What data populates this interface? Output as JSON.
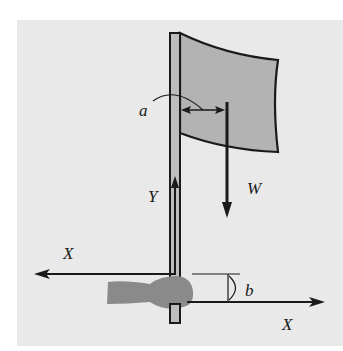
{
  "figure": {
    "colors": {
      "background": "#e9e9e9",
      "flag_fill": "#b3b3b3",
      "pole_fill": "#bdbdbd",
      "hand_fill": "#8a8a8a",
      "stroke": "#1a1a1a"
    },
    "labels": {
      "a": "a",
      "b": "b",
      "W": "W",
      "Y": "Y",
      "X_left": "X",
      "X_right": "X"
    },
    "forces": [
      {
        "name": "W",
        "direction": "down",
        "meaning": "weight of flag acting at its centre"
      },
      {
        "name": "Y",
        "direction": "up",
        "meaning": "vertical force at hand"
      },
      {
        "name": "X_left",
        "direction": "left",
        "meaning": "horizontal force at upper grip"
      },
      {
        "name": "X_right",
        "direction": "right",
        "meaning": "horizontal force at lower grip"
      }
    ],
    "dimensions": [
      {
        "name": "a",
        "meaning": "horizontal distance from pole to line of action of W"
      },
      {
        "name": "b",
        "meaning": "vertical separation between the two X forces"
      }
    ]
  }
}
